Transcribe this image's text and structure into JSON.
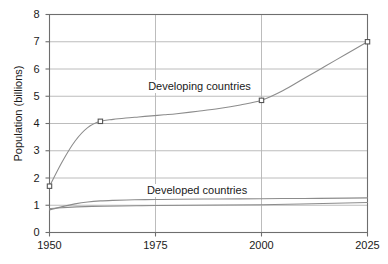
{
  "chart_data": {
    "type": "line",
    "title": "",
    "subtitle": "",
    "xlabel": "",
    "ylabel": "Population (billions)",
    "xlim": [
      1950,
      2025
    ],
    "ylim": [
      0,
      8
    ],
    "xticks": [
      "1950",
      "1975",
      "2000",
      "2025"
    ],
    "xtick_values": [
      1950,
      1975,
      2000,
      2025
    ],
    "yticks": [
      "0",
      "1",
      "2",
      "3",
      "4",
      "5",
      "6",
      "7",
      "8"
    ],
    "ytick_values": [
      0,
      1,
      2,
      3,
      4,
      5,
      6,
      7,
      8
    ],
    "grid": "horizontal-and-major-vertical",
    "legend": "inline-annotations",
    "line_color": "#8c8c8c",
    "grid_color": "#b4b4b4",
    "axis_color": "#6e6e6e",
    "marker_color": "#555555",
    "series": [
      {
        "name": "Developing countries",
        "label_x": 1986,
        "label_y": 5.35,
        "x": [
          1950,
          1953,
          1956,
          1959,
          1962,
          1965,
          1968,
          1971,
          1974,
          1977,
          1980,
          1985,
          1990,
          1995,
          2000,
          2005,
          2010,
          2015,
          2020,
          2025
        ],
        "values": [
          1.7,
          2.6,
          3.35,
          3.85,
          4.08,
          4.15,
          4.2,
          4.24,
          4.28,
          4.32,
          4.36,
          4.45,
          4.55,
          4.68,
          4.85,
          5.2,
          5.65,
          6.1,
          6.55,
          7.0
        ],
        "markers": [
          {
            "x": 1950,
            "y": 1.7
          },
          {
            "x": 1962,
            "y": 4.08
          },
          {
            "x": 2000,
            "y": 4.85
          },
          {
            "x": 2025,
            "y": 7.0
          }
        ]
      },
      {
        "name": "Developed countries",
        "label_x": 1985,
        "label_y": 1.52,
        "x": [
          1950,
          1953,
          1956,
          1959,
          1962,
          1965,
          1970,
          1975,
          1980,
          1990,
          2000,
          2010,
          2020,
          2025
        ],
        "values": [
          0.83,
          0.95,
          1.05,
          1.12,
          1.16,
          1.18,
          1.2,
          1.21,
          1.22,
          1.23,
          1.24,
          1.25,
          1.26,
          1.27
        ],
        "markers": []
      },
      {
        "name": "Developed countries lower band",
        "label_x": null,
        "label_y": null,
        "x": [
          1950,
          1960,
          1975,
          2000,
          2025
        ],
        "values": [
          0.88,
          0.96,
          0.99,
          1.02,
          1.1
        ],
        "markers": []
      }
    ]
  },
  "axis_titles": {
    "y": "Population (billions)"
  },
  "annotations": {
    "developing": "Developing countries",
    "developed": "Developed countries"
  }
}
